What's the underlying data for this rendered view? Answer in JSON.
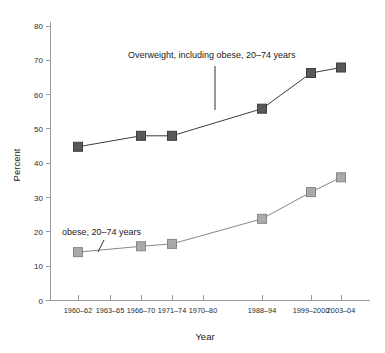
{
  "chart_data": {
    "type": "line",
    "title": "",
    "xlabel": "Year",
    "ylabel": "Percent",
    "ylim": [
      0,
      80
    ],
    "ytick_values": [
      0,
      10,
      20,
      30,
      40,
      50,
      60,
      70,
      80
    ],
    "ytick_labels": [
      "0",
      "10",
      "20",
      "30",
      "40",
      "50",
      "60",
      "70",
      "80"
    ],
    "grid": false,
    "legend_position": "inline-annotations",
    "categories": [
      "1960–62",
      "1963–65",
      "1966–70",
      "1971–74",
      "1970–80",
      "1988–94",
      "1999–2000",
      "2003–04"
    ],
    "x_positions_px": [
      78,
      110,
      141,
      172,
      203,
      262,
      311,
      341
    ],
    "series": [
      {
        "name": "Overweight, including obese, 20–74 years",
        "color": "#595959",
        "edge_color": "#3d3d3d",
        "marker": "square",
        "values": [
          44.8,
          48.0,
          48.0,
          null,
          null,
          55.9,
          66.3,
          67.9
        ],
        "points": [
          {
            "category": "1960–62",
            "value": 44.8
          },
          {
            "category": "1966–70",
            "value": 48.0
          },
          {
            "category": "1971–74",
            "value": 48.0
          },
          {
            "category": "1988–94",
            "value": 55.9
          },
          {
            "category": "1999–2000",
            "value": 66.3
          },
          {
            "category": "2003–04",
            "value": 67.9
          }
        ]
      },
      {
        "name": "obese, 20–74 years",
        "color": "#aaaaaa",
        "edge_color": "#868686",
        "marker": "square",
        "values": [
          14.1,
          null,
          15.8,
          16.5,
          null,
          23.8,
          31.6,
          35.9
        ],
        "points": [
          {
            "category": "1960–62",
            "value": 14.1
          },
          {
            "category": "1966–70",
            "value": 15.8
          },
          {
            "category": "1971–74",
            "value": 16.5
          },
          {
            "category": "1988–94",
            "value": 23.8
          },
          {
            "category": "1999–2000",
            "value": 31.6
          },
          {
            "category": "2003–04",
            "value": 35.9
          }
        ]
      }
    ],
    "annotations": [
      {
        "name": "overweight-annotation",
        "text": "Overweight, including obese, 20–74 years",
        "text_x": 128,
        "text_y": 58,
        "leader": {
          "x1": 215,
          "y1": 66,
          "x2": 215,
          "y2": 110
        }
      },
      {
        "name": "obese-annotation",
        "text": "obese, 20–74 years",
        "text_x": 62,
        "text_y": 235,
        "leader": {
          "x1": 104,
          "y1": 240,
          "x2": 98,
          "y2": 252
        }
      }
    ]
  },
  "colors": {
    "background": "#ffffff",
    "axis": "#9a9a9a",
    "text": "#1a1a1a",
    "series_dark": "#595959",
    "series_light": "#aaaaaa"
  }
}
